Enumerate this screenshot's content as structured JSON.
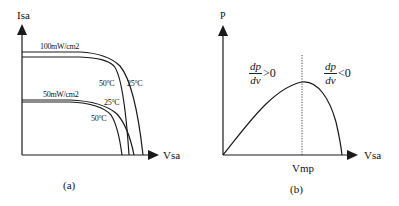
{
  "figure_a": {
    "y_axis_label": "Isa",
    "x_axis_label": "Vsa",
    "caption": "(a)",
    "irradiance_labels": [
      "100mW/cm2",
      "50mW/cm2"
    ],
    "temperature_labels": {
      "high_50": "50°C",
      "high_25": "25°C",
      "low_25": "25°C",
      "low_50": "50°C"
    }
  },
  "figure_b": {
    "y_axis_label": "P",
    "x_axis_label": "Vsa",
    "x_tick_label": "Vmp",
    "caption": "(b)",
    "left_annotation": {
      "num": "dp",
      "den": "dv",
      "op": ">0"
    },
    "right_annotation": {
      "num": "dp",
      "den": "dv",
      "op": "<0"
    }
  },
  "colors": {
    "line": "#1a1a1a",
    "background": "#ffffff"
  }
}
